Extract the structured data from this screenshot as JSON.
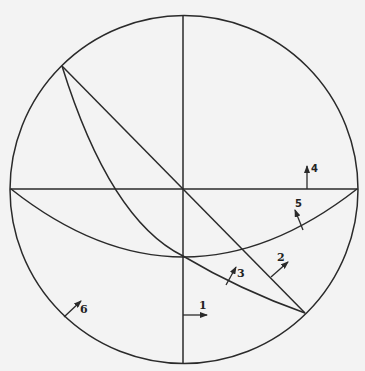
{
  "diagram": {
    "type": "stereographic-net",
    "colors": {
      "line": "#2a2a2a",
      "background": "#f3f3f3"
    },
    "labels": [
      {
        "id": "1",
        "text": "1"
      },
      {
        "id": "2",
        "text": "2"
      },
      {
        "id": "3",
        "text": "3"
      },
      {
        "id": "4",
        "text": "4"
      },
      {
        "id": "5",
        "text": "5"
      },
      {
        "id": "6",
        "text": "6"
      }
    ]
  }
}
